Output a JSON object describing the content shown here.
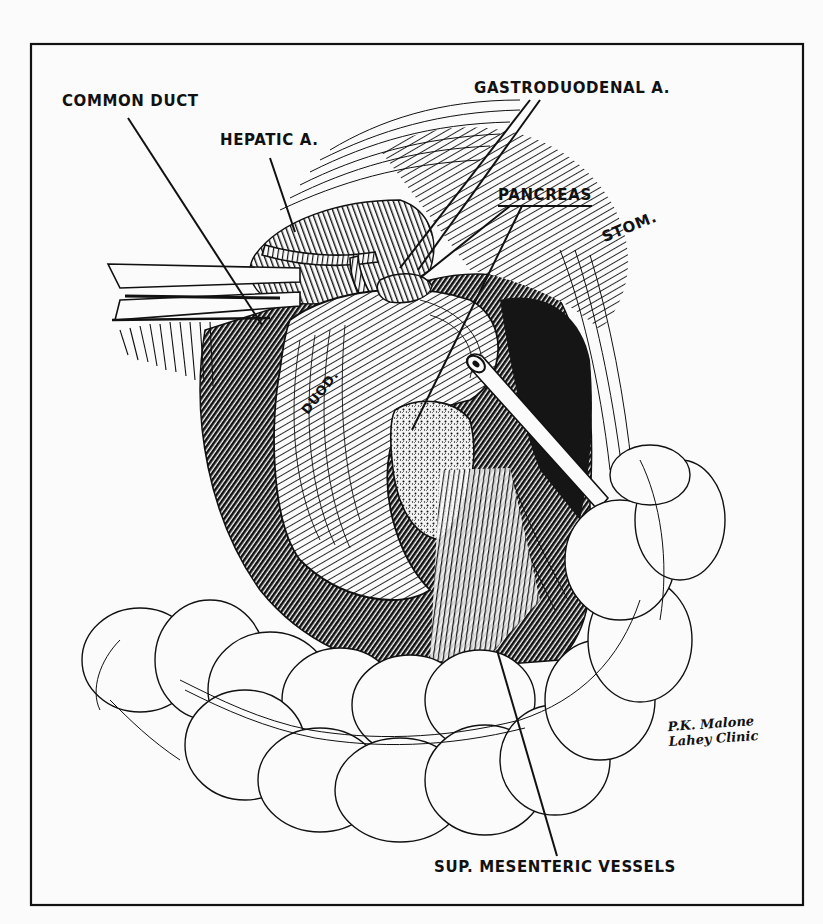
{
  "figure": {
    "type": "surgical-illustration",
    "background": "#fbfbfb",
    "ink": "#111111",
    "frame": {
      "x": 31,
      "y": 44,
      "width": 772,
      "height": 861
    }
  },
  "labels": {
    "common_duct": "COMMON DUCT",
    "hepatic_a": "HEPATIC A.",
    "gastroduodenal_a": "GASTRODUODENAL A.",
    "pancreas": "PANCREAS",
    "stom": "STOM.",
    "duod": "DUOD.",
    "sup_mesenteric_vessels": "SUP. MESENTERIC VESSELS"
  },
  "signature": {
    "line1": "P.K. Malone",
    "line2": "Lahey Clinic"
  }
}
